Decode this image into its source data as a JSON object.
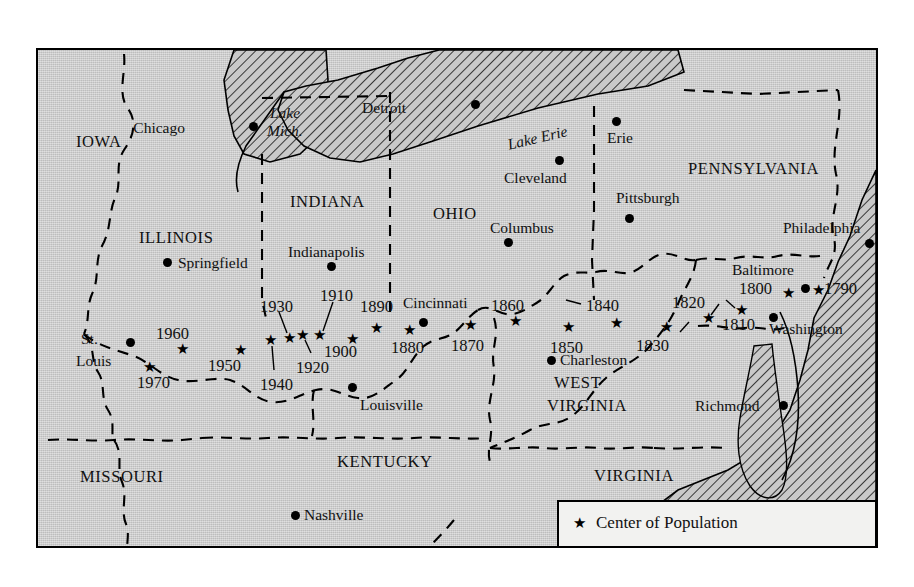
{
  "map": {
    "background_color": "#c9c9c9",
    "border_color": "#000000",
    "states": [
      {
        "name": "IOWA",
        "x": 38,
        "y": 84,
        "size": "state"
      },
      {
        "name": "ILLINOIS",
        "x": 101,
        "y": 180,
        "size": "state"
      },
      {
        "name": "INDIANA",
        "x": 252,
        "y": 144,
        "size": "state"
      },
      {
        "name": "OHIO",
        "x": 395,
        "y": 156,
        "size": "state"
      },
      {
        "name": "PENNSYLVANIA",
        "x": 650,
        "y": 111,
        "size": "state"
      },
      {
        "name": "WEST",
        "x": 516,
        "y": 325,
        "size": "state"
      },
      {
        "name": "VIRGINIA",
        "x": 509,
        "y": 348,
        "size": "state"
      },
      {
        "name": "MISSOURI",
        "x": 42,
        "y": 419,
        "size": "state"
      },
      {
        "name": "KENTUCKY",
        "x": 299,
        "y": 404,
        "size": "state"
      },
      {
        "name": "VIRGINIA",
        "x": 556,
        "y": 418,
        "size": "state"
      },
      {
        "name": "ARK.",
        "x": 43,
        "y": 511,
        "size": "state"
      },
      {
        "name": "TENNESSEE",
        "x": 204,
        "y": 522,
        "size": "state"
      },
      {
        "name": "NORTH",
        "x": 423,
        "y": 506,
        "size": "state"
      },
      {
        "name": "CAROLINA",
        "x": 411,
        "y": 529,
        "size": "state"
      }
    ],
    "lakes": [
      {
        "name": "Lake",
        "x": 232,
        "y": 55
      },
      {
        "name": "Mich.",
        "x": 229,
        "y": 73
      },
      {
        "name": "Lake Erie",
        "x": 469,
        "y": 80
      }
    ],
    "cities": [
      {
        "name": "Chicago",
        "dot_x": 215,
        "dot_y": 76,
        "label_x": 147,
        "label_y": 70,
        "anchor": "right"
      },
      {
        "name": "Detroit",
        "dot_x": 437,
        "dot_y": 54,
        "label_x": 368,
        "label_y": 50,
        "anchor": "right"
      },
      {
        "name": "Erie",
        "dot_x": 578,
        "dot_y": 71,
        "label_x": 569,
        "label_y": 80,
        "anchor": "left"
      },
      {
        "name": "Cleveland",
        "dot_x": 521,
        "dot_y": 110,
        "label_x": 466,
        "label_y": 120,
        "anchor": "left"
      },
      {
        "name": "Pittsburgh",
        "dot_x": 591,
        "dot_y": 168,
        "label_x": 578,
        "label_y": 140,
        "anchor": "left"
      },
      {
        "name": "Columbus",
        "dot_x": 470,
        "dot_y": 192,
        "label_x": 452,
        "label_y": 170,
        "anchor": "left"
      },
      {
        "name": "Philadelphia",
        "dot_x": 831,
        "dot_y": 193,
        "label_x": 745,
        "label_y": 170,
        "anchor": "left"
      },
      {
        "name": "Indianapolis",
        "dot_x": 293,
        "dot_y": 216,
        "label_x": 250,
        "label_y": 194,
        "anchor": "left"
      },
      {
        "name": "Springfield",
        "dot_x": 129,
        "dot_y": 212,
        "label_x": 140,
        "label_y": 205,
        "anchor": "left"
      },
      {
        "name": "Baltimore",
        "dot_x": 767,
        "dot_y": 238,
        "label_x": 694,
        "label_y": 212,
        "anchor": "left"
      },
      {
        "name": "Cincinnati",
        "dot_x": 385,
        "dot_y": 272,
        "label_x": 365,
        "label_y": 245,
        "anchor": "left"
      },
      {
        "name": "St.",
        "dot_x": -1,
        "dot_y": -1,
        "label_x": 43,
        "label_y": 281,
        "anchor": "left"
      },
      {
        "name": "Louis",
        "dot_x": 92,
        "dot_y": 292,
        "label_x": 38,
        "label_y": 303,
        "anchor": "left"
      },
      {
        "name": "Washington",
        "dot_x": 735,
        "dot_y": 267,
        "label_x": 731,
        "label_y": 271,
        "anchor": "left"
      },
      {
        "name": "Louisville",
        "dot_x": 314,
        "dot_y": 337,
        "label_x": 322,
        "label_y": 347,
        "anchor": "left"
      },
      {
        "name": "Charleston",
        "dot_x": 513,
        "dot_y": 310,
        "label_x": 522,
        "label_y": 302,
        "anchor": "left"
      },
      {
        "name": "Richmond",
        "dot_x": 745,
        "dot_y": 355,
        "label_x": 657,
        "label_y": 348,
        "anchor": "left"
      },
      {
        "name": "Nashville",
        "dot_x": 257,
        "dot_y": 465,
        "label_x": 266,
        "label_y": 457,
        "anchor": "left"
      }
    ],
    "population_centers": [
      {
        "year": "1790",
        "star_x": 781,
        "star_y": 240,
        "label_x": 786,
        "label_y": 231,
        "leader": null
      },
      {
        "year": "1800",
        "star_x": 751,
        "star_y": 243,
        "label_x": 701,
        "label_y": 231,
        "leader": null
      },
      {
        "year": "1810",
        "star_x": 671,
        "star_y": 268,
        "label_x": 684,
        "label_y": 267,
        "leader": [
          [
            673,
            265
          ],
          [
            681,
            254
          ]
        ]
      },
      {
        "year": "1820",
        "star_x": 704,
        "star_y": 260,
        "label_x": 634,
        "label_y": 245,
        "leader": [
          [
            697,
            258
          ],
          [
            688,
            250
          ]
        ]
      },
      {
        "year": "1830",
        "star_x": 629,
        "star_y": 277,
        "label_x": 598,
        "label_y": 288,
        "leader": [
          [
            642,
            282
          ],
          [
            651,
            272
          ]
        ]
      },
      {
        "year": "1840",
        "star_x": 579,
        "star_y": 273,
        "label_x": 548,
        "label_y": 248,
        "leader": [
          [
            543,
            254
          ],
          [
            528,
            250
          ]
        ]
      },
      {
        "year": "1850",
        "star_x": 531,
        "star_y": 277,
        "label_x": 512,
        "label_y": 290,
        "leader": null
      },
      {
        "year": "1860",
        "star_x": 478,
        "star_y": 271,
        "label_x": 453,
        "label_y": 248,
        "leader": null
      },
      {
        "year": "1870",
        "star_x": 433,
        "star_y": 275,
        "label_x": 413,
        "label_y": 288,
        "leader": null
      },
      {
        "year": "1880",
        "star_x": 372,
        "star_y": 280,
        "label_x": 353,
        "label_y": 290,
        "leader": null
      },
      {
        "year": "1890",
        "star_x": 339,
        "star_y": 278,
        "label_x": 322,
        "label_y": 249,
        "leader": null
      },
      {
        "year": "1900",
        "star_x": 315,
        "star_y": 289,
        "label_x": 286,
        "label_y": 294,
        "leader": null
      },
      {
        "year": "1910",
        "star_x": 282,
        "star_y": 285,
        "label_x": 282,
        "label_y": 238,
        "leader": [
          [
            285,
            281
          ],
          [
            295,
            252
          ]
        ]
      },
      {
        "year": "1920",
        "star_x": 265,
        "star_y": 285,
        "label_x": 258,
        "label_y": 310,
        "leader": [
          [
            267,
            290
          ],
          [
            273,
            303
          ]
        ]
      },
      {
        "year": "1930",
        "star_x": 252,
        "star_y": 288,
        "label_x": 222,
        "label_y": 249,
        "leader": [
          [
            249,
            283
          ],
          [
            241,
            262
          ]
        ]
      },
      {
        "year": "1940",
        "star_x": 233,
        "star_y": 290,
        "label_x": 222,
        "label_y": 327,
        "leader": [
          [
            234,
            296
          ],
          [
            236,
            320
          ]
        ]
      },
      {
        "year": "1950",
        "star_x": 203,
        "star_y": 300,
        "label_x": 170,
        "label_y": 308,
        "leader": null
      },
      {
        "year": "1960",
        "star_x": 145,
        "star_y": 299,
        "label_x": 118,
        "label_y": 276,
        "leader": null
      },
      {
        "year": "1970",
        "star_x": 112,
        "star_y": 317,
        "label_x": 99,
        "label_y": 325,
        "leader": null
      }
    ]
  },
  "legend": {
    "star_glyph": "★",
    "star_label": "Center of Population",
    "scale": {
      "ticks": [
        "0",
        "50",
        "100"
      ],
      "unit": "MI",
      "segments": 8
    }
  }
}
